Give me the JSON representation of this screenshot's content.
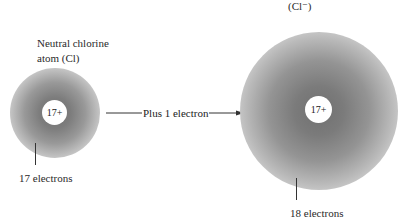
{
  "diagram": {
    "neutral_atom": {
      "title_line1": "Neutral chlorine",
      "title_line2": "atom (Cl)",
      "nucleus_charge": "17+",
      "electron_label": "17 electrons"
    },
    "ion": {
      "title_symbol": "(Cl⁻)",
      "nucleus_charge": "17+",
      "electron_label": "18 electrons"
    },
    "arrow_label": "Plus 1 electron",
    "colors": {
      "cloud": "#7a7a7a",
      "nucleus": "#ffffff",
      "line": "#333333"
    }
  }
}
